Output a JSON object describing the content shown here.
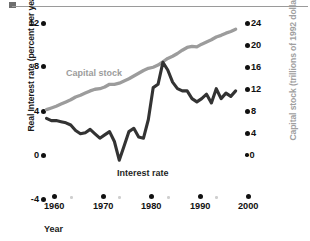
{
  "chart_data": {
    "type": "line",
    "title": "",
    "xlabel": "Year",
    "ylabel_left": "Real Interest rate (percent per year)",
    "ylabel_right": "Capital stock (trillions of 1992 dollars)",
    "xlim": [
      1957,
      2001
    ],
    "ylim_left": [
      -4,
      12
    ],
    "ylim_right": [
      -4.8,
      24
    ],
    "grid": false,
    "legend_position": "inline-annotations",
    "xticks_major": [
      "1960",
      "1970",
      "1980",
      "1990",
      "2000"
    ],
    "xticks_major_values": [
      1960,
      1970,
      1980,
      1990,
      2000
    ],
    "xticks_minor_values": [
      1965,
      1975,
      1985,
      1995
    ],
    "yticks_left": [
      "12",
      "8",
      "4",
      "0",
      "-4"
    ],
    "yticks_left_values": [
      12,
      8,
      4,
      0,
      -4
    ],
    "yticks_right": [
      "24",
      "20",
      "16",
      "12",
      "8",
      "4",
      "0"
    ],
    "yticks_right_values": [
      24,
      20,
      16,
      12,
      8,
      4,
      0
    ],
    "colors": {
      "interest_rate": "#333333",
      "capital_stock": "#9c9c9c",
      "axis_text": "#111111",
      "right_axis_title": "#a0a0a0",
      "background": "#ffffff"
    },
    "series": [
      {
        "name": "Interest rate",
        "axis": "left",
        "color": "#333333",
        "units": "percent per year",
        "x": [
          1960,
          1961,
          1962,
          1963,
          1964,
          1965,
          1966,
          1967,
          1968,
          1969,
          1970,
          1971,
          1972,
          1973,
          1974,
          1975,
          1976,
          1977,
          1978,
          1979,
          1980,
          1981,
          1982,
          1983,
          1984,
          1985,
          1986,
          1987,
          1988,
          1989,
          1990,
          1991,
          1992,
          1993,
          1994,
          1995,
          1996,
          1997,
          1998,
          1999
        ],
        "values": [
          3.1,
          2.9,
          2.9,
          2.8,
          2.7,
          2.5,
          2.0,
          1.7,
          1.8,
          2.1,
          1.7,
          1.3,
          1.6,
          1.9,
          1.0,
          -0.7,
          0.6,
          1.9,
          2.2,
          1.4,
          1.3,
          3.0,
          5.9,
          6.2,
          8.2,
          7.5,
          6.4,
          5.8,
          5.6,
          5.6,
          4.9,
          4.6,
          4.9,
          5.3,
          4.5,
          5.8,
          4.9,
          5.4,
          5.1,
          5.6
        ]
      },
      {
        "name": "Capital stock",
        "axis": "right",
        "color": "#9c9c9c",
        "units": "trillions of 1992 dollars",
        "x": [
          1960,
          1961,
          1962,
          1963,
          1964,
          1965,
          1966,
          1967,
          1968,
          1969,
          1970,
          1971,
          1972,
          1973,
          1974,
          1975,
          1976,
          1977,
          1978,
          1979,
          1980,
          1981,
          1982,
          1983,
          1984,
          1985,
          1986,
          1987,
          1988,
          1989,
          1990,
          1991,
          1992,
          1993,
          1994,
          1995,
          1996,
          1997,
          1998,
          1999
        ],
        "values": [
          7.8,
          8.1,
          8.4,
          8.8,
          9.2,
          9.6,
          10.1,
          10.4,
          10.8,
          11.2,
          11.5,
          11.6,
          11.9,
          12.4,
          12.4,
          12.6,
          13.0,
          13.4,
          13.9,
          14.4,
          14.9,
          15.3,
          15.5,
          15.9,
          16.5,
          17.1,
          17.5,
          18.0,
          18.6,
          19.1,
          19.3,
          19.2,
          19.7,
          20.1,
          20.5,
          21.0,
          21.3,
          21.7,
          22.0,
          22.4
        ]
      }
    ],
    "annotations": [
      {
        "text": "Capital stock",
        "series": "Capital stock"
      },
      {
        "text": "Interest rate",
        "series": "Interest rate"
      }
    ]
  }
}
